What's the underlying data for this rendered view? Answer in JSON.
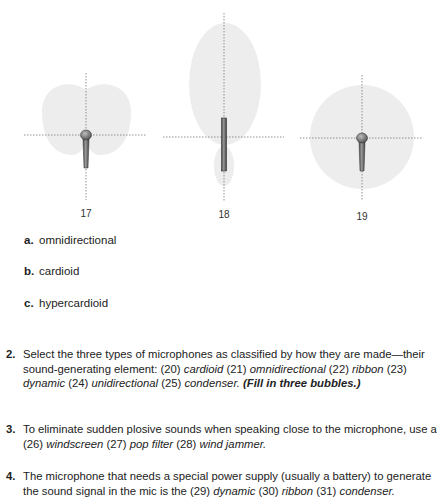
{
  "figures": [
    {
      "id": "17",
      "label": "17",
      "pattern": "cardioid",
      "mic": "handheld"
    },
    {
      "id": "18",
      "label": "18",
      "pattern": "hypercardioid",
      "mic": "ribbon-bar"
    },
    {
      "id": "19",
      "label": "19",
      "pattern": "omnidirectional",
      "mic": "handheld"
    }
  ],
  "choices": [
    {
      "letter": "a.",
      "text": "omnidirectional"
    },
    {
      "letter": "b.",
      "text": "cardioid"
    },
    {
      "letter": "c.",
      "text": "hypercardioid"
    }
  ],
  "questions": [
    {
      "number": "2.",
      "prefix": "Select the three types of microphones as classified by how they are made—their sound-generating element:",
      "options": [
        {
          "num": "(20)",
          "text": "cardioid"
        },
        {
          "num": "(21)",
          "text": "omnidirectional"
        },
        {
          "num": "(22)",
          "text": "ribbon"
        },
        {
          "num": "(23)",
          "text": "dynamic"
        },
        {
          "num": "(24)",
          "text": "unidirectional"
        },
        {
          "num": "(25)",
          "text": "condenser."
        }
      ],
      "instruction": "(Fill in three bubbles.)"
    },
    {
      "number": "3.",
      "prefix": "To eliminate sudden plosive sounds when speaking close to the microphone, use a",
      "options": [
        {
          "num": "(26)",
          "text": "windscreen"
        },
        {
          "num": "(27)",
          "text": "pop filter"
        },
        {
          "num": "(28)",
          "text": "wind jammer."
        }
      ]
    },
    {
      "number": "4.",
      "prefix": "The microphone that needs a special power supply (usually a battery) to generate the sound signal in the mic is the",
      "options": [
        {
          "num": "(29)",
          "text": "dynamic"
        },
        {
          "num": "(30)",
          "text": "ribbon"
        },
        {
          "num": "(31)",
          "text": "condenser."
        }
      ]
    }
  ],
  "colors": {
    "pattern_fill": "#ececec",
    "axis_dots": "#777777",
    "mic_body": "#6b6b6b"
  }
}
